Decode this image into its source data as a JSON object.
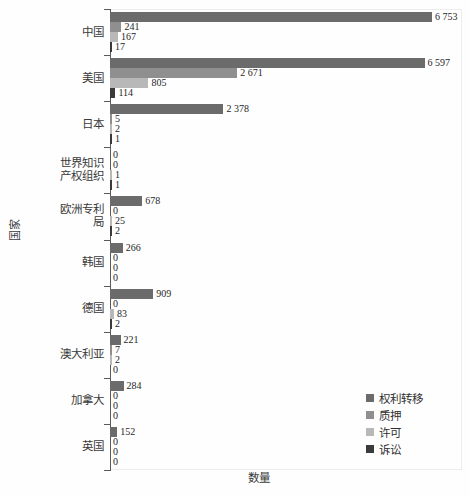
{
  "chart_data": {
    "type": "bar",
    "orientation": "horizontal",
    "grouped": true,
    "title": "",
    "xlabel": "数量",
    "ylabel": "国家",
    "xlim": [
      0,
      7000
    ],
    "grid": false,
    "legend_position": "bottom-right",
    "categories": [
      "中国",
      "美国",
      "日本",
      "世界知识产权组织",
      "欧洲专利局",
      "韩国",
      "德国",
      "澳大利亚",
      "加拿大",
      "英国"
    ],
    "series": [
      {
        "name": "权利转移",
        "color": "#6b6b6b",
        "values": [
          6753,
          6597,
          2378,
          0,
          678,
          266,
          909,
          221,
          284,
          152
        ],
        "labels": [
          "6 753",
          "6 597",
          "2 378",
          "0",
          "678",
          "266",
          "909",
          "221",
          "284",
          "152"
        ]
      },
      {
        "name": "质押",
        "color": "#8f8f8f",
        "values": [
          241,
          2671,
          5,
          0,
          0,
          0,
          0,
          7,
          0,
          0
        ],
        "labels": [
          "241",
          "2 671",
          "5",
          "0",
          "0",
          "0",
          "0",
          "7",
          "0",
          "0"
        ]
      },
      {
        "name": "许可",
        "color": "#b8b8b8",
        "values": [
          167,
          805,
          2,
          1,
          25,
          0,
          83,
          2,
          0,
          0
        ],
        "labels": [
          "167",
          "805",
          "2",
          "1",
          "25",
          "0",
          "83",
          "2",
          "0",
          "0"
        ]
      },
      {
        "name": "诉讼",
        "color": "#3a3a3a",
        "values": [
          17,
          114,
          1,
          1,
          2,
          0,
          2,
          0,
          0,
          0
        ],
        "labels": [
          "17",
          "114",
          "1",
          "1",
          "2",
          "0",
          "2",
          "0",
          "0",
          "0"
        ]
      }
    ]
  }
}
